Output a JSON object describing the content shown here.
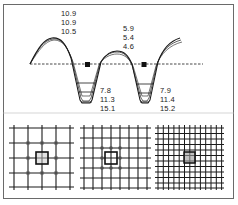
{
  "figure": {
    "frame_color": "#6a6a6a",
    "line_color": "#1a1a1a",
    "top_panel": {
      "description": "Wavy profile with three overlaid curves crossing a dashed baseline; two wells with three depth levels each",
      "peak_labels": {
        "peak1": [
          "10.9",
          "10.9",
          "10.5"
        ],
        "peak2": [
          "5.9",
          "5.4",
          "4.6"
        ]
      },
      "well_labels": {
        "well1": [
          "7.8",
          "11.3",
          "15.1"
        ],
        "well2": [
          "7.9",
          "11.4",
          "15.2"
        ]
      },
      "markers": [
        "filled-square",
        "filled-square"
      ]
    },
    "bottom_panels": [
      {
        "name": "coarse-grid",
        "vertical_lines": 5,
        "horizontal_lines": 5,
        "highlight": "center-cell-box",
        "nodes": "circles-around-center"
      },
      {
        "name": "medium-grid",
        "vertical_lines": 8,
        "horizontal_lines": 7,
        "highlight": "center-cell-box",
        "nodes": "circles-around-center"
      },
      {
        "name": "fine-grid",
        "vertical_lines": 13,
        "horizontal_lines": 12,
        "highlight": "center-shaded-box",
        "nodes": "none"
      }
    ]
  }
}
